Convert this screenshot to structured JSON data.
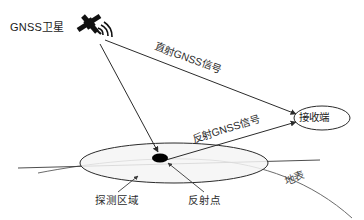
{
  "diagram": {
    "nodes": {
      "satellite_label": "GNSS卫星",
      "receiver_label": "接收端"
    },
    "signals": {
      "direct_label": "直射GNSS信号",
      "reflected_label": "反射GNSS信号"
    },
    "annotations": {
      "detection_area_label": "探测区域",
      "reflection_point_label": "反射点",
      "ground_surface_label": "地表"
    },
    "icons": {
      "satellite": "satellite-icon",
      "signal_waves": "signal-wave-icon",
      "reflection_point": "reflection-point-dot"
    },
    "colors": {
      "background": "#ffffff",
      "stroke": "#2b2b2b",
      "ellipse_fill": "#f4f4f4",
      "ground_stroke": "#6b6b6b",
      "point_fill": "#000000",
      "text": "#1a1a1a"
    },
    "geometry": {
      "satellite_position": [
        92,
        26
      ],
      "receiver_position": [
        322,
        118
      ],
      "reflection_point_position": [
        160,
        158
      ],
      "detection_ellipse_center": [
        174,
        163
      ],
      "detection_ellipse_radii": [
        94,
        20
      ]
    }
  }
}
